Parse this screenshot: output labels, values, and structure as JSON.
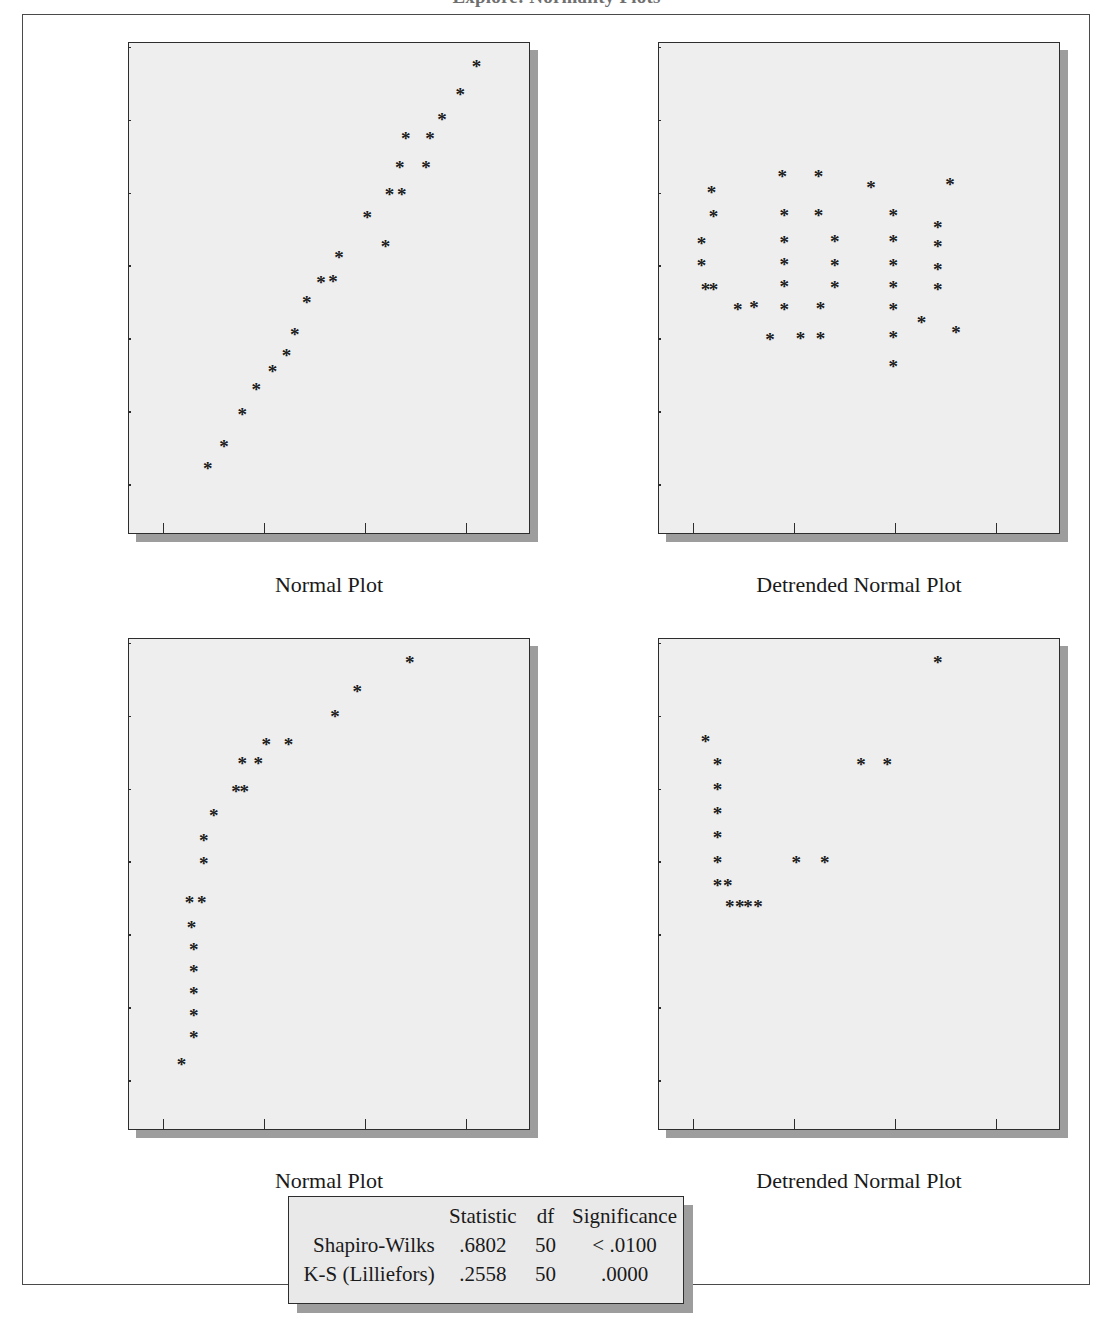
{
  "title": "Explore: Normality Plots",
  "axes": {
    "y_ticks": [
      "2.40",
      "1.60",
      ".80",
      ".00",
      "-.80",
      "-1.60",
      "-2.40"
    ],
    "y_values": [
      2.4,
      1.6,
      0.8,
      0.0,
      -0.8,
      -1.6,
      -2.4
    ],
    "x_ticks": [
      ".00",
      "50,000",
      "100,000",
      "150,000"
    ],
    "x_values": [
      0,
      50000,
      100000,
      150000
    ]
  },
  "stats_table": {
    "headers": [
      "",
      "Statistic",
      "df",
      "Significance"
    ],
    "rows": [
      {
        "name": "Shapiro-Wilks",
        "statistic": ".6802",
        "df": "50",
        "significance": "< .0100"
      },
      {
        "name": "K-S (Lilliefors)",
        "statistic": ".2558",
        "df": "50",
        "significance": ".0000"
      }
    ]
  },
  "chart_data": [
    {
      "id": "normal-plot-top",
      "type": "scatter",
      "title": "",
      "xlabel": "Normal Plot",
      "ylabel": "",
      "xlim": [
        -17000,
        182000
      ],
      "ylim": [
        -2.95,
        2.45
      ],
      "grid": false,
      "marker": "*",
      "points": [
        [
          22000,
          -2.22
        ],
        [
          30000,
          -1.98
        ],
        [
          39000,
          -1.63
        ],
        [
          46000,
          -1.35
        ],
        [
          54000,
          -1.16
        ],
        [
          61000,
          -0.98
        ],
        [
          65000,
          -0.75
        ],
        [
          71000,
          -0.4
        ],
        [
          78000,
          -0.18
        ],
        [
          84000,
          -0.17
        ],
        [
          87000,
          0.1
        ],
        [
          101000,
          0.53
        ],
        [
          110000,
          0.22
        ],
        [
          112000,
          0.79
        ],
        [
          118000,
          0.79
        ],
        [
          117000,
          1.08
        ],
        [
          130000,
          1.08
        ],
        [
          120000,
          1.4
        ],
        [
          132000,
          1.4
        ],
        [
          138000,
          1.61
        ],
        [
          147000,
          1.89
        ],
        [
          155000,
          2.19
        ]
      ]
    },
    {
      "id": "detrended-normal-plot-top",
      "type": "scatter",
      "title": "",
      "xlabel": "Detrended Normal Plot",
      "ylabel": "",
      "xlim": [
        -17000,
        182000
      ],
      "ylim": [
        -2.95,
        2.45
      ],
      "grid": false,
      "marker": "*",
      "points": [
        [
          4000,
          0.25
        ],
        [
          4000,
          0.01
        ],
        [
          6000,
          -0.25
        ],
        [
          10000,
          -0.25
        ],
        [
          9000,
          0.81
        ],
        [
          10000,
          0.55
        ],
        [
          22000,
          -0.48
        ],
        [
          30000,
          -0.45
        ],
        [
          38000,
          -0.8
        ],
        [
          44000,
          0.99
        ],
        [
          45000,
          0.56
        ],
        [
          45000,
          0.26
        ],
        [
          45000,
          0.02
        ],
        [
          45000,
          -0.22
        ],
        [
          45000,
          -0.47
        ],
        [
          53000,
          -0.79
        ],
        [
          62000,
          0.99
        ],
        [
          62000,
          0.56
        ],
        [
          63000,
          -0.79
        ],
        [
          63000,
          -0.46
        ],
        [
          70000,
          0.27
        ],
        [
          70000,
          0.01
        ],
        [
          70000,
          -0.23
        ],
        [
          88000,
          0.86
        ],
        [
          99000,
          0.56
        ],
        [
          99000,
          0.27
        ],
        [
          99000,
          0.01
        ],
        [
          99000,
          -0.23
        ],
        [
          99000,
          -0.47
        ],
        [
          99000,
          -0.78
        ],
        [
          99000,
          -1.1
        ],
        [
          113000,
          -0.62
        ],
        [
          121000,
          0.43
        ],
        [
          121000,
          0.22
        ],
        [
          121000,
          -0.04
        ],
        [
          121000,
          -0.26
        ],
        [
          127000,
          0.9
        ],
        [
          130000,
          -0.73
        ]
      ]
    },
    {
      "id": "normal-plot-bottom",
      "type": "scatter",
      "title": "",
      "xlabel": "Normal Plot",
      "ylabel": "",
      "xlim": [
        -17000,
        182000
      ],
      "ylim": [
        -2.95,
        2.45
      ],
      "grid": false,
      "marker": "*",
      "points": [
        [
          9000,
          -2.22
        ],
        [
          15000,
          -1.92
        ],
        [
          15000,
          -1.68
        ],
        [
          15000,
          -1.44
        ],
        [
          15000,
          -1.2
        ],
        [
          15000,
          -0.96
        ],
        [
          14000,
          -0.72
        ],
        [
          13000,
          -0.44
        ],
        [
          19000,
          -0.44
        ],
        [
          20000,
          -0.01
        ],
        [
          20000,
          0.24
        ],
        [
          25000,
          0.51
        ],
        [
          36000,
          0.78
        ],
        [
          40000,
          0.78
        ],
        [
          39000,
          1.08
        ],
        [
          47000,
          1.08
        ],
        [
          51000,
          1.29
        ],
        [
          62000,
          1.29
        ],
        [
          85000,
          1.6
        ],
        [
          96000,
          1.87
        ],
        [
          122000,
          2.19
        ]
      ]
    },
    {
      "id": "detrended-normal-plot-bottom",
      "type": "scatter",
      "title": "",
      "xlabel": "Detrended Normal Plot",
      "ylabel": "",
      "xlim": [
        -17000,
        182000
      ],
      "ylim": [
        -2.95,
        2.45
      ],
      "grid": false,
      "marker": "*",
      "points": [
        [
          6000,
          1.32
        ],
        [
          12000,
          1.07
        ],
        [
          12000,
          0.8
        ],
        [
          12000,
          0.53
        ],
        [
          12000,
          0.27
        ],
        [
          12000,
          0.0
        ],
        [
          12000,
          -0.26
        ],
        [
          17000,
          -0.26
        ],
        [
          18000,
          -0.49
        ],
        [
          23000,
          -0.49
        ],
        [
          27000,
          -0.49
        ],
        [
          32000,
          -0.49
        ],
        [
          51000,
          0.0
        ],
        [
          65000,
          0.0
        ],
        [
          83000,
          1.07
        ],
        [
          96000,
          1.07
        ],
        [
          121000,
          2.19
        ]
      ]
    }
  ]
}
